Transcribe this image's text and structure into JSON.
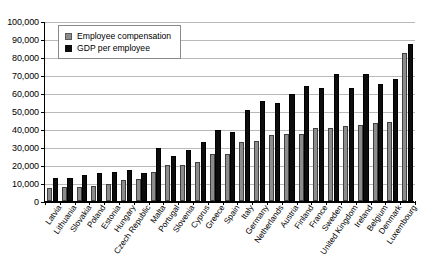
{
  "chart_data": {
    "type": "bar",
    "title": "",
    "xlabel": "",
    "ylabel": "",
    "ylim": [
      0,
      100000
    ],
    "ytick_step": 10000,
    "grid": true,
    "legend_position": "top-left",
    "yticks": [
      "0",
      "10,000",
      "20,000",
      "30,000",
      "40,000",
      "50,000",
      "60,000",
      "70,000",
      "80,000",
      "90,000",
      "100,000"
    ],
    "categories": [
      "Latvia",
      "Lithuania",
      "Slovakia",
      "Poland",
      "Estonia",
      "Hungary",
      "Czech Republic",
      "Malta",
      "Portugal",
      "Slovenia",
      "Cyprus",
      "Greece",
      "Spain",
      "Italy",
      "Germany",
      "Netherlands",
      "Austria",
      "Finland",
      "France",
      "Sweden",
      "United Kingdom",
      "Ireland",
      "Belgium",
      "Denmark",
      "Luxembourg"
    ],
    "series": [
      {
        "name": "Employee compensation",
        "color": "#8c8c8c",
        "values": [
          7500,
          8000,
          8000,
          8500,
          9700,
          11800,
          12300,
          16000,
          19800,
          20200,
          21800,
          26200,
          26300,
          32800,
          33200,
          36500,
          37000,
          37200,
          40300,
          40400,
          41800,
          42500,
          43200,
          44000,
          82500
        ]
      },
      {
        "name": "GDP per employee",
        "color": "#0d0d0d",
        "values": [
          13000,
          13000,
          14300,
          15700,
          16000,
          17000,
          15500,
          29700,
          25000,
          28500,
          32800,
          39500,
          38500,
          50500,
          55500,
          54200,
          59500,
          64000,
          62800,
          70800,
          62700,
          70500,
          65200,
          68000,
          87300
        ]
      }
    ]
  },
  "legend": {
    "items": [
      {
        "label": "Employee compensation",
        "swatch": "gray-square-icon"
      },
      {
        "label": "GDP per employee",
        "swatch": "black-square-icon"
      }
    ]
  }
}
